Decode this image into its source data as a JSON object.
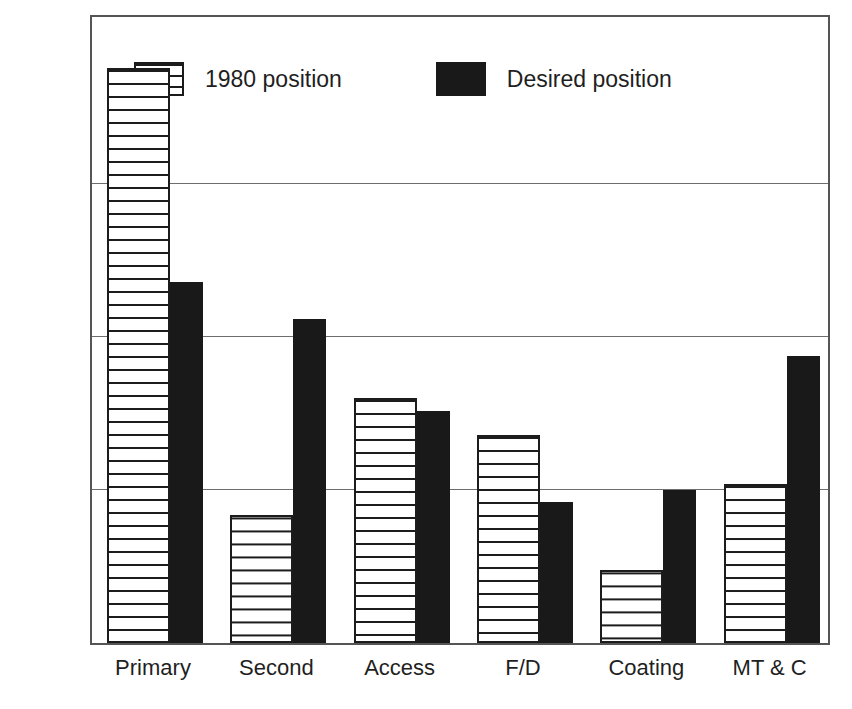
{
  "chart_data": {
    "type": "bar",
    "title": "",
    "subtitle": "",
    "xlabel": "",
    "ylabel": "% of product line",
    "categories": [
      "Primary",
      "Second",
      "Access",
      "F/D",
      "Coating",
      "MT & C"
    ],
    "series": [
      {
        "name": "1980 position",
        "fill": "horizontal-stripes",
        "values": [
          94,
          21,
          40,
          34,
          12,
          26
        ]
      },
      {
        "name": "Desired position",
        "fill": "solid-black",
        "values": [
          59,
          53,
          38,
          23,
          25,
          47
        ]
      }
    ],
    "ylim": [
      0,
      103
    ],
    "yticks": [
      25,
      50,
      75
    ],
    "ytick_labels": [
      "",
      "",
      ""
    ],
    "grid": true,
    "grid_axis": "y",
    "legend": {
      "position": "top-left-inside",
      "entries": [
        "1980 position",
        "Desired position"
      ]
    },
    "colors": {
      "frame": "#555555",
      "gridline": "#6d6d6d",
      "series_1_outline": "#1c1c1c",
      "series_1_fill": "#ffffff",
      "series_2_fill": "#191919",
      "text": "#1f1f1f",
      "background": "#ffffff"
    }
  },
  "legend": {
    "entries": [
      {
        "label": "1980 position",
        "swatch": "striped-swatch-icon"
      },
      {
        "label": "Desired position",
        "swatch": "solid-swatch-icon"
      }
    ]
  },
  "axes": {
    "y_title": "% of product line",
    "x_tick_labels": [
      "Primary",
      "Second",
      "Access",
      "F/D",
      "Coating",
      "MT & C"
    ]
  }
}
